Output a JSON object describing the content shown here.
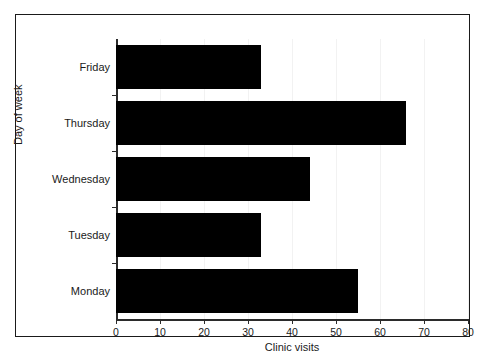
{
  "chart_data": {
    "type": "bar",
    "orientation": "horizontal",
    "title": "",
    "xlabel": "Clinic visits",
    "ylabel": "Day of week",
    "categories": [
      "Friday",
      "Thursday",
      "Wednesday",
      "Tuesday",
      "Monday"
    ],
    "values": [
      33,
      66,
      44,
      33,
      55
    ],
    "xlim": [
      0,
      80
    ],
    "xticks": [
      0,
      10,
      20,
      30,
      40,
      50,
      60,
      70,
      80
    ],
    "xtick_labels": [
      "0",
      "10",
      "20",
      "30",
      "40",
      "50",
      "60",
      "70",
      "80"
    ],
    "grid": false,
    "legend": "none",
    "bar_color": "#000000",
    "axis_color": "#2b2b2b",
    "background": "#ffffff"
  },
  "figure": {
    "border_color": "#1a1a1a",
    "caption": ""
  }
}
